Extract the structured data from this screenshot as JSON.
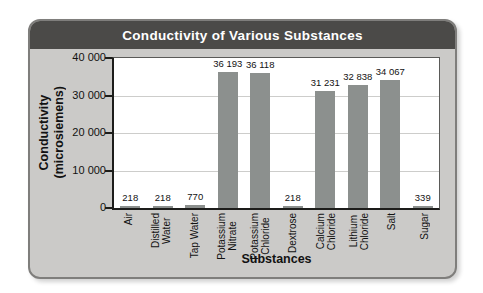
{
  "title": "Conductivity of Various Substances",
  "colors": {
    "header_bg": "#4b4a48",
    "card_bg": "#cbcac8",
    "bar_color": "#8c908e",
    "title_text": "#ffffff"
  },
  "chart_data": {
    "type": "bar",
    "title": "Conductivity of Various Substances",
    "xlabel": "Substances",
    "ylabel": "Conductivity\n(microsiemens)",
    "categories": [
      "Air",
      "Distilled\nWater",
      "Tap Water",
      "Potassium\nNitrate",
      "Potassium\nChloride",
      "Dextrose",
      "Calcium\nChloride",
      "Lithium\nChloride",
      "Salt",
      "Sugar"
    ],
    "values": [
      218,
      218,
      770,
      36193,
      36118,
      218,
      31231,
      32838,
      34067,
      339
    ],
    "value_labels": [
      "218",
      "218",
      "770",
      "36 193",
      "36 118",
      "218",
      "31 231",
      "32 838",
      "34 067",
      "339"
    ],
    "ylim": [
      0,
      40000
    ],
    "yticks": [
      {
        "value": 40000,
        "label": "40 000"
      },
      {
        "value": 30000,
        "label": "30 000"
      },
      {
        "value": 20000,
        "label": "20 000"
      },
      {
        "value": 10000,
        "label": "10 000"
      },
      {
        "value": 0,
        "label": "0"
      }
    ],
    "grid": true,
    "legend": "none"
  }
}
